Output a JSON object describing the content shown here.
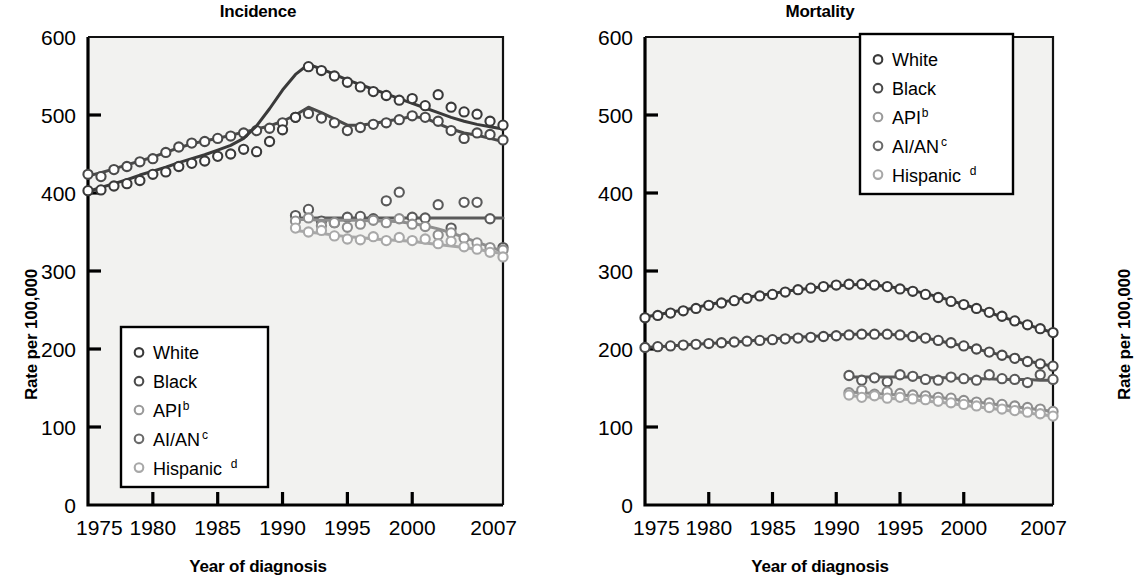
{
  "figure": {
    "background": "#ffffff",
    "panels": [
      "incidence",
      "mortality"
    ]
  },
  "axes": {
    "y_label": "Rate per 100,000",
    "x_label": "Year of diagnosis",
    "y_ticks": [
      "0",
      "100",
      "200",
      "300",
      "400",
      "500",
      "600"
    ],
    "x_ticks": [
      "1975",
      "1980",
      "1985",
      "1990",
      "1995",
      "2000",
      "2007"
    ]
  },
  "legend": {
    "items": [
      {
        "label": "White",
        "sup": "",
        "color": "#3a3a3a"
      },
      {
        "label": "Black",
        "sup": "",
        "color": "#4a4a4a"
      },
      {
        "label": "API",
        "sup": "b",
        "color": "#9a9a9a"
      },
      {
        "label": "AI/AN",
        "sup": "c",
        "color": "#6a6a6a"
      },
      {
        "label": "Hispanic",
        "sup": "d",
        "color": "#a8a8a8"
      }
    ]
  },
  "chart_data": [
    {
      "type": "line",
      "panel": "incidence",
      "title": "Incidence",
      "xlabel": "Year of diagnosis",
      "ylabel": "Rate per 100,000",
      "xlim": [
        1975,
        2007
      ],
      "ylim": [
        0,
        600
      ],
      "ytick_values": [
        0,
        100,
        200,
        300,
        400,
        500,
        600
      ],
      "xtick_values": [
        1975,
        1980,
        1985,
        1990,
        1995,
        2000,
        2007
      ],
      "grid": false,
      "legend_position": "inside-bottom-left",
      "x": [
        1975,
        1976,
        1977,
        1978,
        1979,
        1980,
        1981,
        1982,
        1983,
        1984,
        1985,
        1986,
        1987,
        1988,
        1989,
        1990,
        1991,
        1992,
        1993,
        1994,
        1995,
        1996,
        1997,
        1998,
        1999,
        2000,
        2001,
        2002,
        2003,
        2004,
        2005,
        2006,
        2007
      ],
      "series": [
        {
          "name": "White",
          "color": "#4a4a4a",
          "values": [
            424,
            421,
            430,
            434,
            440,
            444,
            452,
            459,
            464,
            466,
            470,
            473,
            477,
            480,
            483,
            490,
            497,
            502,
            496,
            490,
            480,
            484,
            488,
            490,
            494,
            499,
            497,
            492,
            480,
            470,
            477,
            475,
            468
          ],
          "trend": [
            422,
            426,
            431,
            436,
            441,
            446,
            452,
            458,
            463,
            467,
            470,
            474,
            478,
            482,
            486,
            492,
            500,
            510,
            503,
            495,
            487,
            487,
            489,
            492,
            495,
            498,
            496,
            489,
            482,
            477,
            474,
            470,
            466
          ]
        },
        {
          "name": "Black",
          "color": "#3a3a3a",
          "values": [
            403,
            404,
            409,
            412,
            416,
            424,
            427,
            434,
            438,
            441,
            447,
            450,
            456,
            453,
            466,
            481,
            497,
            562,
            557,
            550,
            542,
            536,
            530,
            525,
            519,
            521,
            512,
            526,
            510,
            504,
            501,
            492,
            487
          ],
          "trend": [
            402,
            407,
            412,
            417,
            423,
            428,
            433,
            439,
            444,
            449,
            455,
            461,
            470,
            486,
            508,
            532,
            552,
            565,
            559,
            552,
            545,
            539,
            533,
            527,
            521,
            515,
            509,
            503,
            497,
            492,
            488,
            485,
            482
          ]
        },
        {
          "name": "AI/AN",
          "color": "#5a5a5a",
          "values": [
            null,
            null,
            null,
            null,
            null,
            null,
            null,
            null,
            null,
            null,
            null,
            null,
            null,
            null,
            null,
            null,
            371,
            379,
            364,
            362,
            369,
            370,
            367,
            390,
            401,
            369,
            368,
            385,
            355,
            388,
            388,
            367,
            330
          ],
          "trend": [
            null,
            null,
            null,
            null,
            null,
            null,
            null,
            null,
            null,
            null,
            null,
            null,
            null,
            null,
            null,
            null,
            368,
            368,
            368,
            368,
            368,
            368,
            368,
            368,
            368,
            368,
            368,
            368,
            368,
            368,
            368,
            368,
            368
          ]
        },
        {
          "name": "API",
          "color": "#8e8e8e",
          "values": [
            null,
            null,
            null,
            null,
            null,
            null,
            null,
            null,
            null,
            null,
            null,
            null,
            null,
            null,
            null,
            null,
            364,
            368,
            358,
            362,
            356,
            360,
            365,
            362,
            367,
            360,
            357,
            346,
            349,
            342,
            336,
            330,
            327
          ],
          "trend": [
            null,
            null,
            null,
            null,
            null,
            null,
            null,
            null,
            null,
            null,
            null,
            null,
            null,
            null,
            null,
            null,
            366,
            366,
            365,
            365,
            365,
            365,
            364,
            364,
            363,
            361,
            358,
            354,
            349,
            343,
            337,
            331,
            325
          ]
        },
        {
          "name": "Hispanic",
          "color": "#a8a8a8",
          "values": [
            null,
            null,
            null,
            null,
            null,
            null,
            null,
            null,
            null,
            null,
            null,
            null,
            null,
            null,
            null,
            null,
            355,
            350,
            352,
            345,
            341,
            340,
            344,
            339,
            343,
            339,
            341,
            335,
            338,
            331,
            328,
            324,
            318
          ],
          "trend": [
            null,
            null,
            null,
            null,
            null,
            null,
            null,
            null,
            null,
            null,
            null,
            null,
            null,
            null,
            null,
            null,
            352,
            350,
            348,
            346,
            344,
            343,
            341,
            340,
            339,
            338,
            336,
            334,
            332,
            330,
            328,
            325,
            322
          ]
        }
      ]
    },
    {
      "type": "line",
      "panel": "mortality",
      "title": "Mortality",
      "xlabel": "Year of diagnosis",
      "ylabel": "Rate per 100,000",
      "xlim": [
        1975,
        2007
      ],
      "ylim": [
        0,
        600
      ],
      "ytick_values": [
        0,
        100,
        200,
        300,
        400,
        500,
        600
      ],
      "xtick_values": [
        1975,
        1980,
        1985,
        1990,
        1995,
        2000,
        2007
      ],
      "grid": false,
      "legend_position": "inside-top-right",
      "x": [
        1975,
        1976,
        1977,
        1978,
        1979,
        1980,
        1981,
        1982,
        1983,
        1984,
        1985,
        1986,
        1987,
        1988,
        1989,
        1990,
        1991,
        1992,
        1993,
        1994,
        1995,
        1996,
        1997,
        1998,
        1999,
        2000,
        2001,
        2002,
        2003,
        2004,
        2005,
        2006,
        2007
      ],
      "series": [
        {
          "name": "Black",
          "color": "#3a3a3a",
          "values": [
            240,
            243,
            246,
            249,
            252,
            256,
            259,
            262,
            265,
            268,
            270,
            273,
            276,
            278,
            280,
            282,
            283,
            283,
            282,
            280,
            277,
            274,
            270,
            266,
            261,
            257,
            252,
            247,
            242,
            236,
            231,
            226,
            221
          ],
          "trend": [
            241,
            244,
            247,
            250,
            253,
            257,
            260,
            263,
            266,
            269,
            271,
            274,
            276,
            278,
            280,
            281,
            282,
            283,
            282,
            280,
            278,
            275,
            271,
            267,
            262,
            257,
            252,
            247,
            241,
            236,
            231,
            226,
            221
          ]
        },
        {
          "name": "White",
          "color": "#4a4a4a",
          "values": [
            202,
            203,
            204,
            205,
            206,
            207,
            208,
            209,
            210,
            211,
            212,
            213,
            214,
            215,
            216,
            217,
            218,
            219,
            219,
            219,
            218,
            216,
            214,
            211,
            208,
            204,
            200,
            196,
            192,
            188,
            184,
            181,
            178
          ],
          "trend": [
            202,
            203,
            204,
            205,
            206,
            207,
            208,
            209,
            210,
            212,
            213,
            214,
            215,
            216,
            217,
            218,
            219,
            219,
            219,
            219,
            218,
            216,
            214,
            211,
            207,
            204,
            200,
            196,
            192,
            188,
            185,
            181,
            178
          ]
        },
        {
          "name": "AI/AN",
          "color": "#5a5a5a",
          "values": [
            null,
            null,
            null,
            null,
            null,
            null,
            null,
            null,
            null,
            null,
            null,
            null,
            null,
            null,
            null,
            null,
            166,
            160,
            163,
            158,
            167,
            165,
            161,
            160,
            164,
            162,
            160,
            167,
            162,
            161,
            157,
            167,
            161
          ],
          "trend": [
            null,
            null,
            null,
            null,
            null,
            null,
            null,
            null,
            null,
            null,
            null,
            null,
            null,
            null,
            null,
            null,
            164,
            164,
            164,
            164,
            164,
            164,
            163,
            163,
            163,
            162,
            162,
            162,
            161,
            161,
            161,
            160,
            160
          ]
        },
        {
          "name": "API",
          "color": "#8e8e8e",
          "values": [
            null,
            null,
            null,
            null,
            null,
            null,
            null,
            null,
            null,
            null,
            null,
            null,
            null,
            null,
            null,
            null,
            144,
            147,
            142,
            145,
            143,
            141,
            140,
            138,
            137,
            134,
            132,
            131,
            129,
            127,
            125,
            123,
            120
          ],
          "trend": [
            null,
            null,
            null,
            null,
            null,
            null,
            null,
            null,
            null,
            null,
            null,
            null,
            null,
            null,
            null,
            null,
            145,
            144,
            143,
            142,
            141,
            140,
            139,
            138,
            136,
            134,
            132,
            130,
            128,
            126,
            124,
            122,
            120
          ]
        },
        {
          "name": "Hispanic",
          "color": "#a8a8a8",
          "values": [
            null,
            null,
            null,
            null,
            null,
            null,
            null,
            null,
            null,
            null,
            null,
            null,
            null,
            null,
            null,
            null,
            141,
            138,
            140,
            137,
            138,
            136,
            135,
            133,
            131,
            129,
            127,
            125,
            123,
            121,
            119,
            117,
            114
          ],
          "trend": [
            null,
            null,
            null,
            null,
            null,
            null,
            null,
            null,
            null,
            null,
            null,
            null,
            null,
            null,
            null,
            null,
            140,
            139,
            138,
            137,
            136,
            135,
            133,
            132,
            130,
            128,
            126,
            124,
            122,
            120,
            118,
            116,
            114
          ]
        }
      ]
    }
  ]
}
